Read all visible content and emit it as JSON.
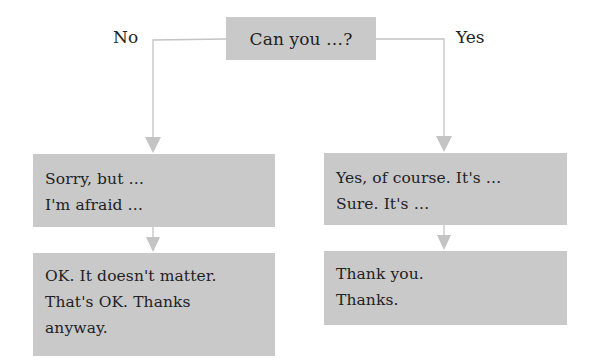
{
  "diagram": {
    "type": "flowchart",
    "colors": {
      "box_fill": "#c9c9c9",
      "connector": "#c4c4c4",
      "text": "#222222",
      "background": "#ffffff"
    },
    "question": {
      "label": "Can you …?"
    },
    "branches": {
      "no": {
        "label": "No",
        "response": {
          "lines": [
            "Sorry, but …",
            "I'm afraid …"
          ]
        },
        "reply": {
          "lines": [
            "OK. It doesn't matter.",
            "That's OK. Thanks",
            "anyway."
          ]
        }
      },
      "yes": {
        "label": "Yes",
        "response": {
          "lines": [
            "Yes, of course. It's …",
            "Sure. It's …"
          ]
        },
        "reply": {
          "lines": [
            "Thank you.",
            "Thanks."
          ]
        }
      }
    }
  }
}
